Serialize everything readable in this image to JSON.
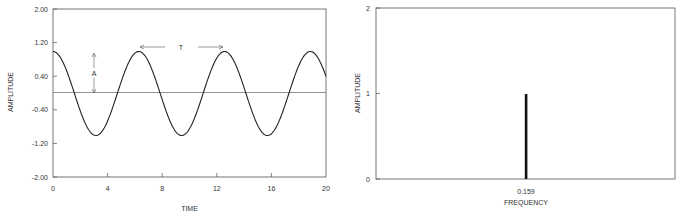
{
  "chart_data": [
    {
      "type": "line",
      "title": "",
      "xlabel": "TIME",
      "ylabel": "AMPLITUDE",
      "xlim": [
        0,
        20
      ],
      "ylim": [
        -2.0,
        2.0
      ],
      "x_ticks": [
        "0",
        "4",
        "8",
        "12",
        "16",
        "20"
      ],
      "y_ticks": [
        "2.00",
        "1.20",
        "0.40",
        "-0.40",
        "-1.20",
        "-2.00"
      ],
      "grid": false,
      "series": [
        {
          "name": "cos(t)",
          "function": "y = 1.0 * cos(t)",
          "amplitude": 1.0,
          "period": 6.283,
          "x": [
            0,
            1.571,
            3.142,
            4.712,
            6.283,
            7.854,
            9.425,
            10.996,
            12.566,
            14.137,
            15.708,
            17.279,
            18.85,
            20
          ],
          "values": [
            1,
            0,
            -1,
            0,
            1,
            0,
            -1,
            0,
            1,
            0,
            -1,
            0,
            1,
            0.408
          ]
        },
        {
          "name": "baseline",
          "x": [
            0,
            20
          ],
          "values": [
            0,
            0
          ]
        }
      ],
      "annotations": [
        {
          "text": "A",
          "description": "double arrow from 0 to peak amplitude at t≈3",
          "x": 3,
          "y_from": 0,
          "y_to": 1.0
        },
        {
          "text": "T",
          "description": "double arrow spanning one period between peaks",
          "x_from": 6.28,
          "x_to": 12.57,
          "y": 1.1
        }
      ]
    },
    {
      "type": "bar",
      "title": "",
      "xlabel": "FREQUENCY",
      "ylabel": "AMPLITUDE",
      "ylim": [
        0,
        2
      ],
      "y_ticks": [
        "0",
        "1",
        "2"
      ],
      "x_ticks": [
        "0.159"
      ],
      "grid": false,
      "categories": [
        "0.159"
      ],
      "values": [
        1
      ]
    }
  ],
  "left": {
    "xlabel": "TIME",
    "ylabel": "AMPLITUDE",
    "yticks": [
      "2.00",
      "1.20",
      "0.40",
      "-0.40",
      "-1.20",
      "-2.00"
    ],
    "xticks": [
      "0",
      "4",
      "8",
      "12",
      "16",
      "20"
    ],
    "annot_A": "A",
    "annot_T": "T"
  },
  "right": {
    "xlabel": "FREQUENCY",
    "ylabel": "AMPLITUDE",
    "yticks": [
      "2",
      "1",
      "0"
    ],
    "xtick": "0.159"
  }
}
